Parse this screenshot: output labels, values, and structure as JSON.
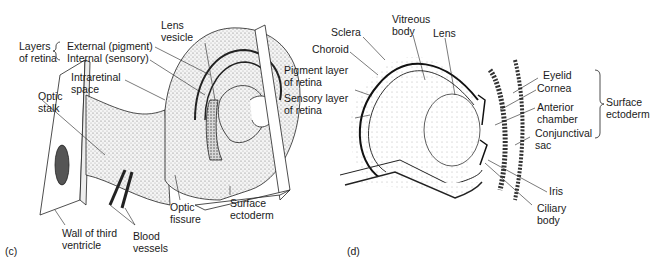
{
  "figure": {
    "panels": [
      {
        "id": "c",
        "letter": "(c)",
        "labels": {
          "layers_of_retina": "Layers\nof retina",
          "external_pigment": "External (pigment)",
          "internal_sensory": "Internal (sensory)",
          "lens_vesicle": "Lens\nvesicle",
          "intraretinal_space": "Intraretinal\nspace",
          "optic_stalk": "Optic\nstalk",
          "optic_fissure": "Optic\nfissure",
          "surface_ectoderm": "Surface\nectoderm",
          "wall_of_third_ventricle": "Wall of third\nventricle",
          "blood_vessels": "Blood\nvessels"
        }
      },
      {
        "id": "d",
        "letter": "(d)",
        "labels": {
          "sclera": "Sclera",
          "choroid": "Choroid",
          "pigment_layer": "Pigment layer\nof retina",
          "sensory_layer": "Sensory layer\nof retina",
          "vitreous_body": "Vitreous\nbody",
          "lens": "Lens",
          "eyelid": "Eyelid",
          "cornea": "Cornea",
          "anterior_chamber": "Anterior\nchamber",
          "conjunctival_sac": "Conjunctival\nsac",
          "surface_ectoderm": "Surface\nectoderm",
          "iris": "Iris",
          "ciliary_body": "Ciliary\nbody"
        }
      }
    ]
  }
}
